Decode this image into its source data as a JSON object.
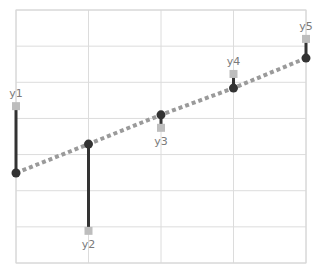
{
  "chart_data": {
    "type": "scatter",
    "title": "",
    "xlabel": "",
    "ylabel": "",
    "grid": true,
    "legend": null,
    "x": [
      1,
      2,
      3,
      4,
      5
    ],
    "xlim": [
      1,
      5
    ],
    "ylim": [
      0,
      7
    ],
    "series": [
      {
        "name": "observed",
        "marker": "square",
        "color": "#bdbdbd",
        "values": [
          4.34,
          0.89,
          3.74,
          5.23,
          6.2
        ]
      },
      {
        "name": "fitted",
        "marker": "circle",
        "line": "dashed",
        "color": "#333333",
        "line_color": "#9a9a9a",
        "values": [
          2.49,
          3.29,
          4.1,
          4.84,
          5.67
        ]
      }
    ],
    "residual_stems": true,
    "point_labels": [
      "y1",
      "y2",
      "y3",
      "y4",
      "y5"
    ],
    "colors": {
      "grid": "#dcdcdc",
      "stem": "#333333",
      "label": "#7a7a7a"
    }
  },
  "labels": [
    "y1",
    "y2",
    "y3",
    "y4",
    "y5"
  ]
}
